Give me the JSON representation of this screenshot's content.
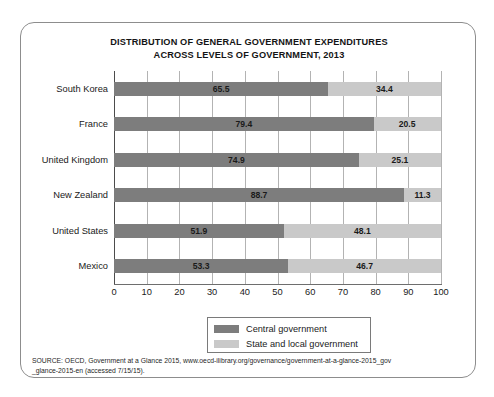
{
  "chart_data": {
    "type": "bar",
    "orientation": "horizontal",
    "stacked": true,
    "normalized": true,
    "title": "DISTRIBUTION OF GENERAL GOVERNMENT EXPENDITURES ACROSS LEVELS OF GOVERNMENT, 2013",
    "title_lines": [
      "DISTRIBUTION OF GENERAL GOVERNMENT EXPENDITURES",
      "ACROSS LEVELS OF GOVERNMENT, 2013"
    ],
    "categories": [
      "South Korea",
      "France",
      "United Kingdom",
      "New Zealand",
      "United States",
      "Mexico"
    ],
    "series": [
      {
        "name": "Central government",
        "color": "#7d7d7d",
        "values": [
          65.5,
          79.4,
          74.9,
          88.7,
          51.9,
          53.3
        ]
      },
      {
        "name": "State and local government",
        "color": "#c9c9c9",
        "values": [
          34.4,
          20.5,
          25.1,
          11.3,
          48.1,
          46.7
        ]
      }
    ],
    "xlabel": "",
    "ylabel": "",
    "xlim": [
      0,
      100
    ],
    "xticks": [
      0,
      10,
      20,
      30,
      40,
      50,
      60,
      70,
      80,
      90,
      100
    ],
    "xtick_labels": [
      "0",
      "10",
      "20",
      "30",
      "40",
      "50",
      "60",
      "70",
      "80",
      "90",
      "100"
    ],
    "grid": true,
    "grid_axis": "x",
    "legend_position": "bottom-center",
    "data_labels": true
  },
  "legend": {
    "items": [
      {
        "label": "Central government",
        "color": "#7d7d7d"
      },
      {
        "label": "State and local government",
        "color": "#c9c9c9"
      }
    ]
  },
  "source": {
    "lines": [
      "SOURCE: OECD, Government at a Glance 2015, www.oecd-ilibrary.org/governance/government-at-a-glance-2015_gov",
      "_glance-2015-en (accessed 7/15/15)."
    ]
  },
  "colors": {
    "central": "#7d7d7d",
    "local": "#c9c9c9",
    "gridline": "#b3b3b3",
    "axis": "#4c4c4c",
    "card_border": "#8d8d8d",
    "text": "#1a1a1a"
  }
}
